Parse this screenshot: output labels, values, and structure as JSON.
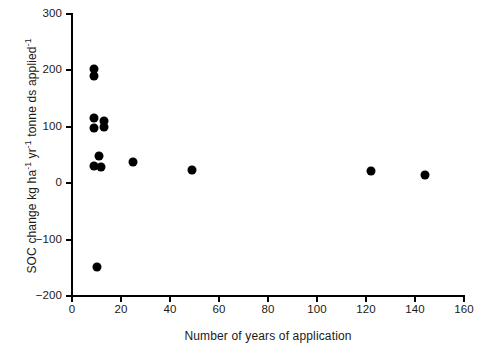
{
  "chart_data": {
    "type": "scatter",
    "title": "",
    "xlabel": "Number of years of application",
    "ylabel": "SOC change kg ha⁻¹ yr⁻¹ tonne ds applied⁻¹",
    "ylabel_parts": {
      "lead": "SOC change kg ha",
      "sup1": "-1",
      "mid1": " yr",
      "sup2": "-1",
      "mid2": " tonne ds applied",
      "sup3": "-1"
    },
    "xlim": [
      0,
      160
    ],
    "ylim": [
      -200,
      300
    ],
    "xticks": [
      0,
      20,
      40,
      60,
      80,
      100,
      120,
      140,
      160
    ],
    "yticks": [
      -200,
      -100,
      0,
      100,
      200,
      300
    ],
    "xtick_labels": [
      "0",
      "20",
      "40",
      "60",
      "80",
      "100",
      "120",
      "140",
      "160"
    ],
    "ytick_labels": [
      "−200",
      "−100",
      "0",
      "100",
      "200",
      "300"
    ],
    "grid": false,
    "legend": null,
    "marker_color": "#000000",
    "marker_shape": "circle",
    "points": [
      {
        "x": 9,
        "y": 203
      },
      {
        "x": 9,
        "y": 190
      },
      {
        "x": 9,
        "y": 116
      },
      {
        "x": 9,
        "y": 97
      },
      {
        "x": 13,
        "y": 111
      },
      {
        "x": 13,
        "y": 100
      },
      {
        "x": 11,
        "y": 48
      },
      {
        "x": 9,
        "y": 30
      },
      {
        "x": 12,
        "y": 28
      },
      {
        "x": 25,
        "y": 37
      },
      {
        "x": 49,
        "y": 23
      },
      {
        "x": 122,
        "y": 21
      },
      {
        "x": 144,
        "y": 14
      },
      {
        "x": 10,
        "y": -148
      }
    ]
  },
  "caption": {
    "fragment": ""
  }
}
